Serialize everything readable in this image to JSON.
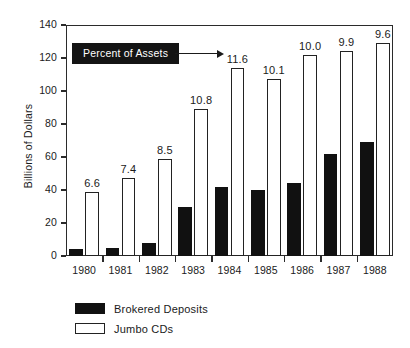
{
  "chart_data": {
    "type": "bar",
    "title": "",
    "xlabel": "",
    "ylabel": "Billions of Dollars",
    "ylim": [
      0,
      140
    ],
    "yticks": [
      0,
      20,
      40,
      60,
      80,
      100,
      120,
      140
    ],
    "ytick_labels": [
      "0",
      "20",
      "40",
      "60",
      "80",
      "100",
      "120",
      "140"
    ],
    "grid": false,
    "legend_position": "bottom-left",
    "categories": [
      "1980",
      "1981",
      "1982",
      "1983",
      "1984",
      "1985",
      "1986",
      "1987",
      "1988"
    ],
    "series": [
      {
        "name": "Brokered Deposits",
        "color": "#111111",
        "values": [
          4,
          5,
          8,
          30,
          42,
          40,
          44,
          62,
          69
        ]
      },
      {
        "name": "Jumbo CDs",
        "color": "#ffffff",
        "values": [
          39,
          47,
          59,
          89,
          114,
          107,
          122,
          124,
          129
        ]
      }
    ],
    "data_labels": {
      "series": "Jumbo CDs",
      "note": "Percent of Assets values shown above each Jumbo CDs bar",
      "values": [
        "6.6",
        "7.4",
        "8.5",
        "10.8",
        "11.6",
        "10.1",
        "10.0",
        "9.9",
        "9.6"
      ]
    },
    "annotation": {
      "text": "Percent of Assets",
      "arrow_target_label": "11.6",
      "box_color": "#141414",
      "text_color": "#ffffff"
    }
  },
  "legend": {
    "items": [
      {
        "label": "Brokered Deposits",
        "style": "dark"
      },
      {
        "label": "Jumbo CDs",
        "style": "light"
      }
    ]
  }
}
